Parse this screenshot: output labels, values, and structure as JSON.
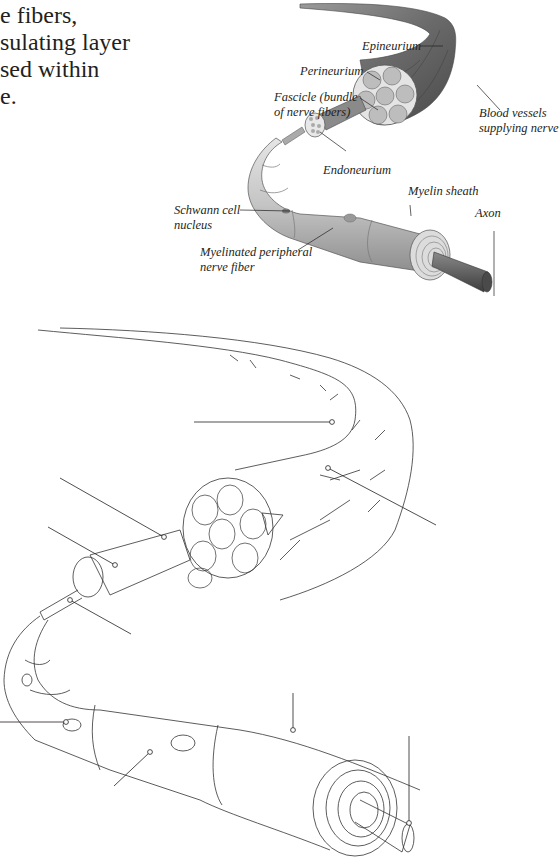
{
  "intro_text": {
    "lines": [
      "e fibers,",
      "sulating layer",
      "sed within",
      "e."
    ]
  },
  "labeled_diagram": {
    "title": "Anatomy of a peripheral nerve (colored)",
    "labels": {
      "epineurium": "Epineurium",
      "perineurium": "Perineurium",
      "fascicle_line1": "Fascicle (bundle",
      "fascicle_line2": "of nerve fibers)",
      "blood_vessels_line1": "Blood vessels",
      "blood_vessels_line2": "supplying nerve",
      "endoneurium": "Endoneurium",
      "myelin_sheath": "Myelin sheath",
      "axon": "Axon",
      "schwann_line1": "Schwann cell",
      "schwann_line2": "nucleus",
      "myelinated_line1": "Myelinated peripheral",
      "myelinated_line2": "nerve fiber"
    },
    "colors": {
      "epineurium_fill": "#6e6e6e",
      "fiber_fill": "#c8c8c8",
      "axon_fill": "#555555",
      "text": "#231f20"
    }
  },
  "blank_diagram": {
    "title": "Unlabeled line drawing of a peripheral nerve",
    "leader_lines_count": 9,
    "stroke_color": "#333333"
  }
}
